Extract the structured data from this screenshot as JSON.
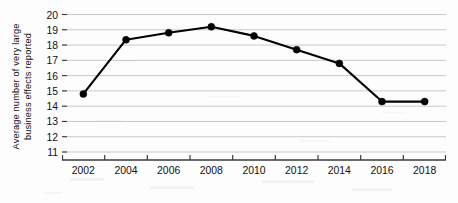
{
  "chart_data": {
    "type": "line",
    "title": "",
    "xlabel": "",
    "ylabel": "Average number of very large business effects reported",
    "ylabel_line1": "Average number of very large",
    "ylabel_line2": "business effects reported",
    "categories": [
      "2002",
      "2004",
      "2006",
      "2008",
      "2010",
      "2012",
      "2014",
      "2016",
      "2018"
    ],
    "x": [
      2002,
      2004,
      2006,
      2008,
      2010,
      2012,
      2014,
      2016,
      2018
    ],
    "values": [
      14.8,
      18.35,
      18.8,
      19.2,
      18.6,
      17.7,
      16.8,
      14.3,
      14.3
    ],
    "series": [
      {
        "name": "Average number of very large business effects reported",
        "values": [
          14.8,
          18.35,
          18.8,
          19.2,
          18.6,
          17.7,
          16.8,
          14.3,
          14.3
        ]
      }
    ],
    "ylim": [
      11,
      20
    ],
    "yticks": [
      11,
      12,
      13,
      14,
      15,
      16,
      17,
      18,
      19,
      20
    ],
    "ytick_labels": [
      "11",
      "12",
      "13",
      "14",
      "15",
      "16",
      "17",
      "18",
      "19",
      "20"
    ],
    "xlim": [
      2001,
      2019
    ],
    "grid": true,
    "grid_axis": "y",
    "grid_color": "#c9c9c9",
    "legend": false,
    "legend_position": "none",
    "line_color": "#000000",
    "marker": "circle",
    "marker_color": "#000000",
    "axis_color": "#3a3a3a",
    "background_color": "#fdfdfd",
    "annotations": []
  }
}
